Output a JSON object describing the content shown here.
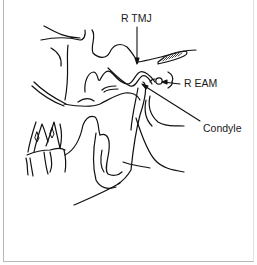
{
  "figure": {
    "labels": {
      "tmj": "R TMJ",
      "eam": "R EAM",
      "condyle": "Condyle"
    },
    "colors": {
      "stroke": "#111111",
      "border": "#b8b8b8",
      "background": "#ffffff"
    }
  }
}
